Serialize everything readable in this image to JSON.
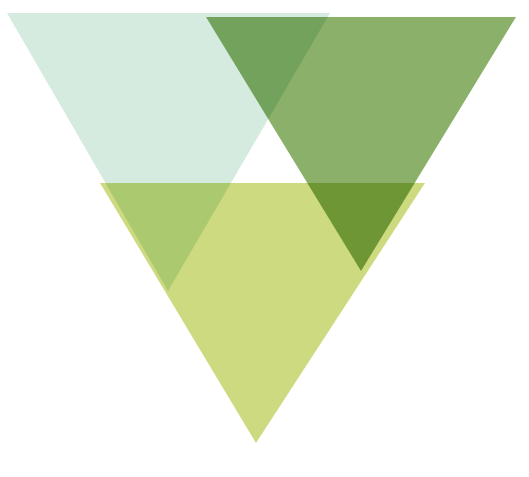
{
  "artwork": {
    "title": "Overlapping Inverted Triangles",
    "width": 529,
    "height": 477,
    "background_color": "#ffffff",
    "style": "flat geometric abstract mark, three translucent downward-pointing triangles with multiply overlap",
    "blend_mode": "multiply",
    "negative_space_note": "white triangular gap between the mint and green triangles above the yellow-green triangle"
  },
  "palette": {
    "background": "#ffffff",
    "mint": "#d5ebdf",
    "green": "#8ab069",
    "yellow_green": "#cdda7f",
    "mint_green_overlap": "#8aae66",
    "green_yellow_overlap": "#a6c154",
    "mint_yellow_overlap": "#c6d989",
    "white_gap": "#ffffff"
  },
  "shapes": [
    {
      "name": "mint-triangle",
      "label": "Mint Triangle",
      "color": "#d5ebdf",
      "orientation": "point-down",
      "points": "7,13 330,13 168,291",
      "vertices": {
        "top_left": [
          7,
          13
        ],
        "top_right": [
          330,
          13
        ],
        "bottom": [
          168,
          291
        ]
      }
    },
    {
      "name": "green-triangle",
      "label": "Green Triangle",
      "color": "#8ab069",
      "orientation": "point-down",
      "points": "206,17 516,17 361,271",
      "vertices": {
        "top_left": [
          206,
          17
        ],
        "top_right": [
          516,
          17
        ],
        "bottom": [
          361,
          271
        ]
      }
    },
    {
      "name": "yellow-green-triangle",
      "label": "Yellow-Green Triangle",
      "color": "#cdda7f",
      "orientation": "point-down",
      "points": "100,183 425,183 256,443",
      "vertices": {
        "top_left": [
          100,
          183
        ],
        "top_right": [
          425,
          183
        ],
        "bottom": [
          256,
          443
        ]
      }
    }
  ]
}
